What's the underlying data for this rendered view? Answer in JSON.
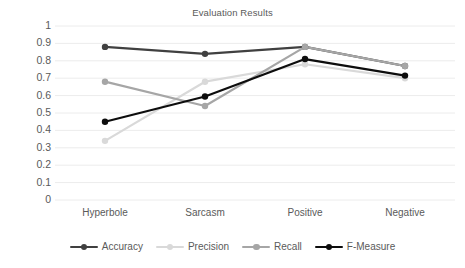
{
  "chart_data": {
    "type": "line",
    "title": "Evaluation Results",
    "xlabel": "",
    "ylabel": "",
    "categories": [
      "Hyperbole",
      "Sarcasm",
      "Positive",
      "Negative"
    ],
    "ylim": [
      0,
      1
    ],
    "yticks": [
      "0",
      "0.1",
      "0.2",
      "0.3",
      "0.4",
      "0.5",
      "0.6",
      "0.7",
      "0.8",
      "0.9",
      "1"
    ],
    "grid": true,
    "legend_position": "bottom",
    "series": [
      {
        "name": "Accuracy",
        "color": "#404040",
        "values": [
          0.88,
          0.84,
          0.88,
          0.77
        ]
      },
      {
        "name": "Precision",
        "color": "#d9d9d9",
        "values": [
          0.34,
          0.68,
          0.78,
          0.7
        ]
      },
      {
        "name": "Recall",
        "color": "#a6a6a6",
        "values": [
          0.68,
          0.54,
          0.88,
          0.77
        ]
      },
      {
        "name": "F-Measure",
        "color": "#0d0d0d",
        "values": [
          0.45,
          0.595,
          0.81,
          0.715
        ]
      }
    ]
  }
}
